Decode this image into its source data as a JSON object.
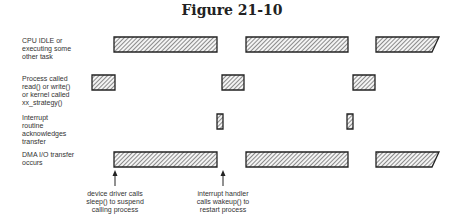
{
  "title": "Figure 21-10",
  "rows": [
    {
      "label": "CPU IDLE or\nexecuting some\nother task",
      "y": 37,
      "h": 15,
      "bars": [
        [
          114,
          217
        ],
        [
          246,
          348
        ],
        [
          376,
          439
        ]
      ],
      "last_slanted": true
    },
    {
      "label": "Process called\nread() or write()\nor kernel called\nxx_strategy()",
      "y": 75,
      "h": 15,
      "bars": [
        [
          92,
          115
        ],
        [
          222,
          244
        ],
        [
          353,
          375
        ]
      ],
      "last_slanted": false
    },
    {
      "label": "Interrupt\nroutine\nacknowledges\ntransfer",
      "y": 114,
      "h": 15,
      "bars": [
        [
          217,
          223
        ],
        [
          347,
          353
        ]
      ],
      "last_slanted": false
    },
    {
      "label": "DMA I/O transfer\noccurs",
      "y": 152,
      "h": 15,
      "bars": [
        [
          114,
          217
        ],
        [
          246,
          348
        ],
        [
          376,
          439
        ]
      ],
      "last_slanted": true
    }
  ],
  "annotations": [
    {
      "x": 115,
      "text": "device driver calls\nsleep() to suspend\ncalling process"
    },
    {
      "x": 223,
      "text": "interrupt handler\ncalls wakeup() to\nrestart process"
    }
  ],
  "colors": {
    "stroke": "#222222",
    "hatch": "#444444",
    "fill": "#f4f4f4"
  }
}
